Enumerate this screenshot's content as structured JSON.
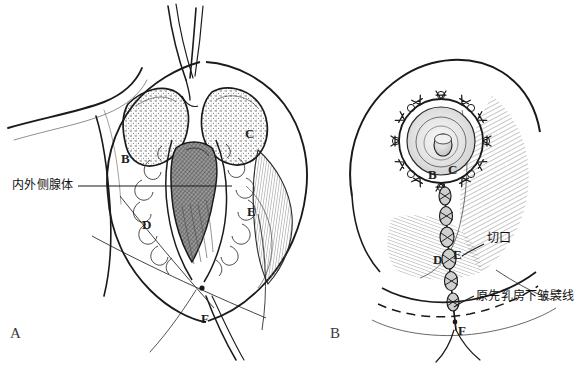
{
  "figure": {
    "kind": "medical-surgical-illustration",
    "style": "pen-and-ink line drawing, black on white",
    "background_color": "#ffffff",
    "ink_color": "#1a1a1a",
    "panel_count": 2
  },
  "panels": [
    {
      "id": "A",
      "label": "A",
      "label_position": {
        "x": 10,
        "y": 326
      },
      "description": "Intraoperative view of breast with vertical incision opened, glandular pillars retracted, surgical retractor at top",
      "markers": [
        {
          "letter": "B",
          "x": 121,
          "y": 152
        },
        {
          "letter": "C",
          "x": 245,
          "y": 127
        },
        {
          "letter": "D",
          "x": 142,
          "y": 218
        },
        {
          "letter": "E",
          "x": 247,
          "y": 205
        },
        {
          "letter": "F",
          "x": 201,
          "y": 312
        }
      ],
      "annotations": [
        {
          "text": "内外侧腺体",
          "x": 12,
          "y": 180,
          "leader_line": {
            "x1": 78,
            "y1": 186,
            "x2": 232,
            "y2": 186
          }
        }
      ]
    },
    {
      "id": "B",
      "label": "B",
      "label_position": {
        "x": 330,
        "y": 326
      },
      "description": "Closed result showing periareolar purse-string sutures and vertical scar down to inframammary fold",
      "markers": [
        {
          "letter": "B",
          "x": 428,
          "y": 186
        },
        {
          "letter": "C",
          "x": 448,
          "y": 180
        },
        {
          "letter": "D",
          "x": 436,
          "y": 265
        },
        {
          "letter": "E",
          "x": 456,
          "y": 258
        },
        {
          "letter": "F",
          "x": 460,
          "y": 330
        }
      ],
      "annotations": [
        {
          "text": "切口",
          "x": 487,
          "y": 234,
          "leader_line": {
            "x1": 484,
            "y1": 244,
            "x2": 463,
            "y2": 254
          }
        },
        {
          "text": "原先乳房下皱襞线",
          "x": 478,
          "y": 292,
          "leader_line": {
            "x1": 474,
            "y1": 296,
            "x2": 455,
            "y2": 306
          }
        }
      ]
    }
  ],
  "colors": {
    "ink": "#1a1a1a",
    "background": "#ffffff",
    "hatch": "#555555",
    "tissue_fill": "#efefef",
    "dark_cavity": "#6e6e6e",
    "medium_shade": "#b5b5b5",
    "light_shade": "#dcdcdc"
  }
}
